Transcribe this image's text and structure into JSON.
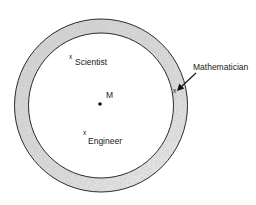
{
  "diagram": {
    "center": {
      "label": "M"
    },
    "points": [
      {
        "id": "scientist",
        "marker": "x",
        "label": "Scientist"
      },
      {
        "id": "engineer",
        "marker": "x",
        "label": "Engineer"
      },
      {
        "id": "mathematician",
        "marker": "x",
        "label": "Mathematician"
      }
    ],
    "colors": {
      "stroke": "#2a2a2a",
      "ring_fill": "#d6d6d6",
      "background": "#ffffff"
    }
  }
}
